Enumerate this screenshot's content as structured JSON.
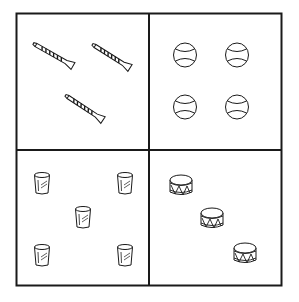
{
  "figure": {
    "colors": {
      "stroke": "#1a1a1a",
      "background": "#ffffff"
    },
    "panels": [
      {
        "id": "top-left",
        "object": "flute",
        "count": 3,
        "items": [
          {
            "x1": 36,
            "y1": 45,
            "x2": 73,
            "y2": 66
          },
          {
            "x1": 95,
            "y1": 46,
            "x2": 130,
            "y2": 68
          },
          {
            "x1": 68,
            "y1": 97,
            "x2": 103,
            "y2": 120
          }
        ]
      },
      {
        "id": "top-right",
        "object": "ball",
        "count": 4,
        "items": [
          {
            "cx": 185,
            "cy": 55
          },
          {
            "cx": 237,
            "cy": 55
          },
          {
            "cx": 185,
            "cy": 107
          },
          {
            "cx": 237,
            "cy": 107
          }
        ]
      },
      {
        "id": "bottom-left",
        "object": "cup",
        "count": 5,
        "items": [
          {
            "cx": 42,
            "cy": 183
          },
          {
            "cx": 125,
            "cy": 183
          },
          {
            "cx": 83,
            "cy": 217
          },
          {
            "cx": 42,
            "cy": 255
          },
          {
            "cx": 125,
            "cy": 255
          }
        ]
      },
      {
        "id": "bottom-right",
        "object": "drum",
        "count": 3,
        "items": [
          {
            "cx": 181,
            "cy": 185
          },
          {
            "cx": 212,
            "cy": 218
          },
          {
            "cx": 245,
            "cy": 253
          }
        ]
      }
    ]
  }
}
